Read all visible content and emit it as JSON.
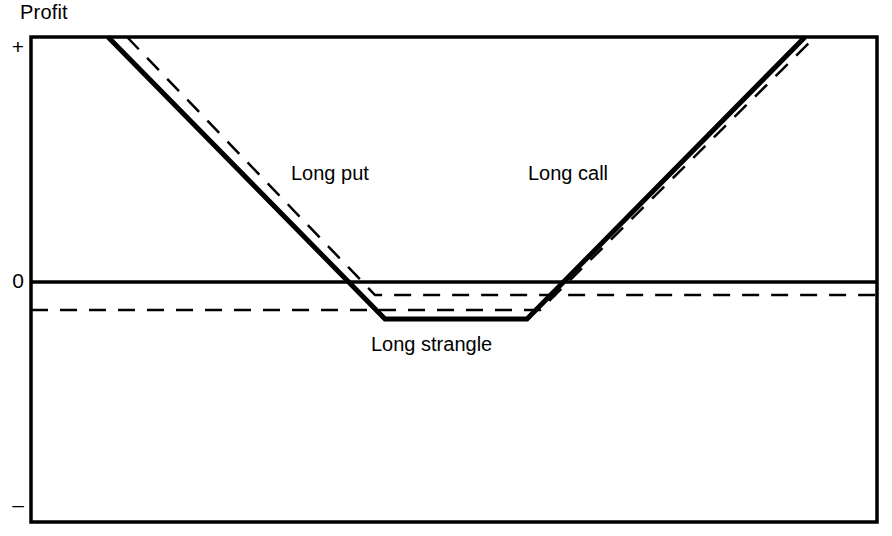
{
  "chart_data": {
    "type": "line",
    "title": "",
    "ylabel": "Profit",
    "xlabel": "",
    "grid": false,
    "legend_position": "inline-annotations",
    "y_tick_labels": [
      "+",
      "0",
      "–"
    ],
    "y_tick_values": [
      1,
      0,
      -1
    ],
    "x_tick_labels": [],
    "axis_ranges": {
      "x_pixel": [
        31,
        877
      ],
      "y_pixel_top_plus": 37,
      "y_pixel_zero": 282,
      "y_pixel_bottom_minus": 522
    },
    "annotations": [
      {
        "text": "Long put",
        "x_px": 291,
        "y_px": 163
      },
      {
        "text": "Long call",
        "x_px": 528,
        "y_px": 163
      },
      {
        "text": "Long strangle",
        "x_px": 371,
        "y_px": 334
      }
    ],
    "series": [
      {
        "name": "Long strangle",
        "style": "solid",
        "width": 5,
        "color": "#000000",
        "points_px": [
          [
            108,
            37
          ],
          [
            385,
            319
          ],
          [
            527,
            319
          ],
          [
            805,
            37
          ]
        ],
        "description": "V-shaped payoff with flat loss floor between the put and call strikes"
      },
      {
        "name": "Long put",
        "style": "dashed",
        "width": 2.5,
        "color": "#000000",
        "points_px": [
          [
            127,
            37
          ],
          [
            375,
            295
          ],
          [
            877,
            295
          ]
        ],
        "description": "Falls to the put premium loss level then stays flat to the right"
      },
      {
        "name": "Long call",
        "style": "dashed",
        "width": 2.5,
        "color": "#000000",
        "points_px": [
          [
            31,
            310
          ],
          [
            540,
            310
          ],
          [
            815,
            37
          ]
        ],
        "description": "Flat at the call premium loss level then rises above the call strike"
      },
      {
        "name": "Zero line",
        "style": "solid",
        "width": 3,
        "color": "#000000",
        "points_px": [
          [
            31,
            282
          ],
          [
            877,
            282
          ]
        ],
        "description": "Break-even profit axis"
      }
    ]
  },
  "labels": {
    "profit": "Profit",
    "tick_plus": "+",
    "tick_zero": "0",
    "tick_minus": "–",
    "long_put": "Long put",
    "long_call": "Long call",
    "long_strangle": "Long strangle"
  },
  "colors": {
    "ink": "#000000",
    "background": "#ffffff"
  }
}
